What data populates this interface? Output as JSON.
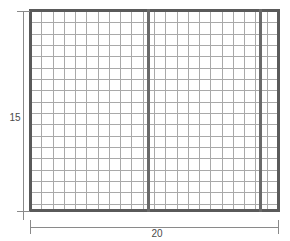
{
  "figure": {
    "type": "engineering-dimension-diagram",
    "background_color": "#ffffff",
    "top_caption": ""
  },
  "panel": {
    "frame_color": "#5a5a5a",
    "post_color": "#6a6a6a",
    "mesh_color": "#a9a9a9",
    "fill_color": "#ffffff",
    "mesh_columns": 22,
    "mesh_rows": 18,
    "interior_posts": [
      {
        "name": "post-1",
        "x": 147
      },
      {
        "name": "post-2",
        "x": 259
      }
    ]
  },
  "dimensions": {
    "line_color": "#8a8a8a",
    "label_color": "#4a4a4a",
    "height": {
      "value": "15",
      "orientation": "vertical",
      "position": "left"
    },
    "width": {
      "value": "20",
      "orientation": "horizontal",
      "position": "bottom"
    }
  },
  "chart_data": {
    "type": "table",
    "categories": [
      "width",
      "height"
    ],
    "values": [
      20,
      15
    ],
    "xlabel": "20",
    "ylabel": "15",
    "annotations": [
      "20",
      "15"
    ]
  }
}
